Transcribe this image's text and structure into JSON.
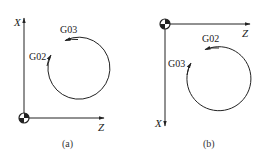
{
  "diagrams": [
    {
      "id": "a",
      "caption": "(a)",
      "x_axis_label": "X",
      "z_axis_label": "Z",
      "label_g03": "G03",
      "label_g02": "G02",
      "description": "X axis up, Z axis right; origin bottom-left"
    },
    {
      "id": "b",
      "caption": "(b)",
      "x_axis_label": "X",
      "z_axis_label": "Z",
      "label_g02": "G02",
      "label_g03": "G03",
      "description": "X axis down, Z axis right; origin top-left"
    }
  ],
  "colors": {
    "line": "#222222",
    "background": "#ffffff"
  }
}
